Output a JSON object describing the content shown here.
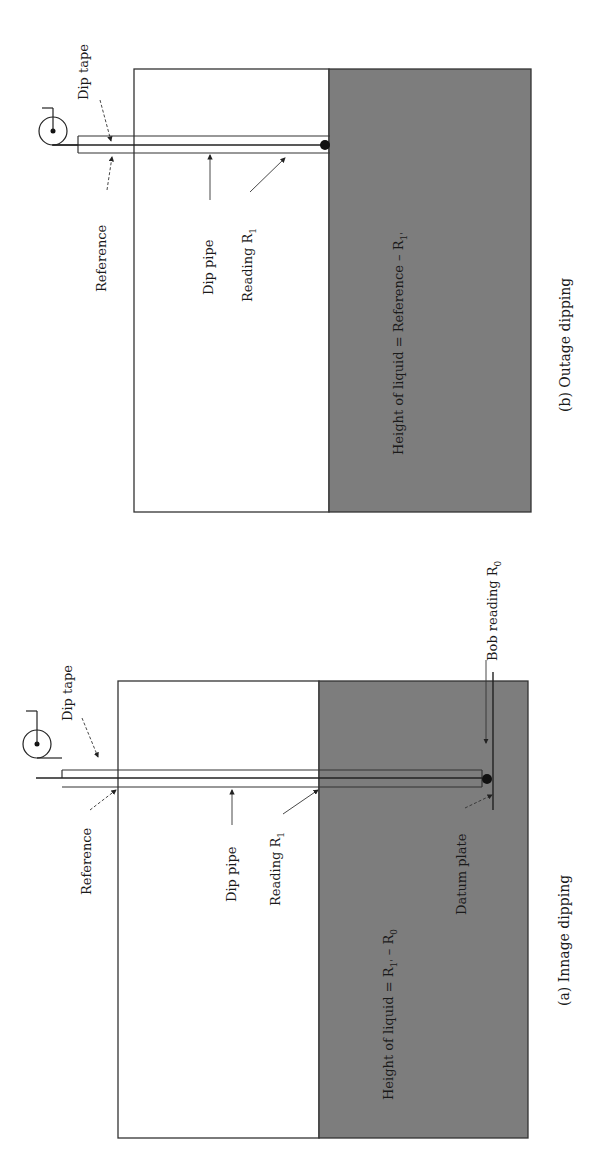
{
  "figure": {
    "orientation": "rotated-90-ccw",
    "colors": {
      "liquid": "#7d7d7d",
      "outline": "#333333",
      "background": "#ffffff"
    },
    "panel_b": {
      "caption": "(b) Outage dipping",
      "labels": {
        "dip_tape": "Dip tape",
        "reference": "Reference",
        "dip_pipe": "Dip pipe",
        "reading_main": "Reading R",
        "reading_sub": "1",
        "formula_main": "Height of liquid = Reference – R",
        "formula_sub": "1'"
      }
    },
    "panel_a": {
      "caption": "(a) Innage dipping",
      "labels": {
        "dip_tape": "Dip tape",
        "reference": "Reference",
        "dip_pipe": "Dip pipe",
        "reading_main": "Reading R",
        "reading_sub": "1",
        "bob_main": "Bob reading R",
        "bob_sub": "0",
        "datum_plate": "Datum plate",
        "formula_main": "Height of liquid = R",
        "formula_sub1": "1'",
        "formula_mid": " – R",
        "formula_sub2": "0"
      }
    }
  }
}
